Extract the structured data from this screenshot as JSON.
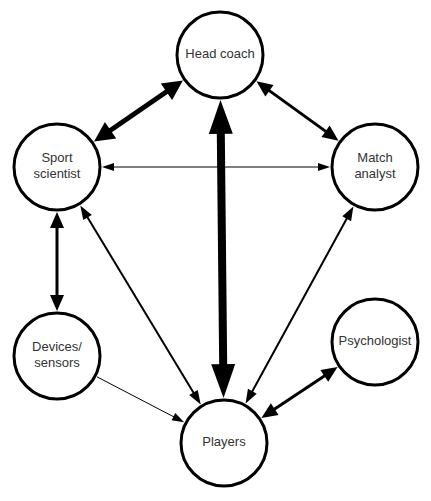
{
  "diagram": {
    "type": "network",
    "nodes": [
      {
        "id": "head_coach",
        "label_lines": [
          "Head coach"
        ]
      },
      {
        "id": "sport_scientist",
        "label_lines": [
          "Sport",
          "scientist"
        ]
      },
      {
        "id": "match_analyst",
        "label_lines": [
          "Match",
          "analyst"
        ]
      },
      {
        "id": "devices_sensors",
        "label_lines": [
          "Devices/",
          "sensors"
        ]
      },
      {
        "id": "psychologist",
        "label_lines": [
          "Psychologist"
        ]
      },
      {
        "id": "players",
        "label_lines": [
          "Players"
        ]
      }
    ],
    "edges": [
      {
        "from": "sport_scientist",
        "to": "head_coach",
        "direction": "both",
        "strength": "strong"
      },
      {
        "from": "head_coach",
        "to": "match_analyst",
        "direction": "both",
        "strength": "medium"
      },
      {
        "from": "head_coach",
        "to": "players",
        "direction": "both",
        "strength": "very-strong"
      },
      {
        "from": "sport_scientist",
        "to": "match_analyst",
        "direction": "both",
        "strength": "weak"
      },
      {
        "from": "sport_scientist",
        "to": "devices_sensors",
        "direction": "both",
        "strength": "medium"
      },
      {
        "from": "sport_scientist",
        "to": "players",
        "direction": "both",
        "strength": "medium-weak"
      },
      {
        "from": "match_analyst",
        "to": "players",
        "direction": "both",
        "strength": "medium-weak"
      },
      {
        "from": "devices_sensors",
        "to": "players",
        "direction": "to",
        "strength": "weak"
      },
      {
        "from": "psychologist",
        "to": "players",
        "direction": "both",
        "strength": "medium"
      }
    ],
    "colors": {
      "stroke": "#000000",
      "fill": "#ffffff",
      "text": "#333333"
    }
  }
}
